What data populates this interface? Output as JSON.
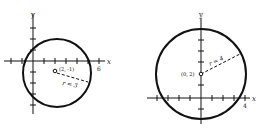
{
  "diagrams": [
    {
      "name": "circle-left",
      "axis_x_label": "x",
      "axis_y_label": "y",
      "center_label": "(2, -1)",
      "radius_label": "r = 3",
      "x_tick_label": "6"
    },
    {
      "name": "circle-right",
      "axis_x_label": "x",
      "axis_y_label": "y",
      "center_label": "(0, 2)",
      "radius_label": "r = 4",
      "x_tick_label": "4"
    }
  ]
}
